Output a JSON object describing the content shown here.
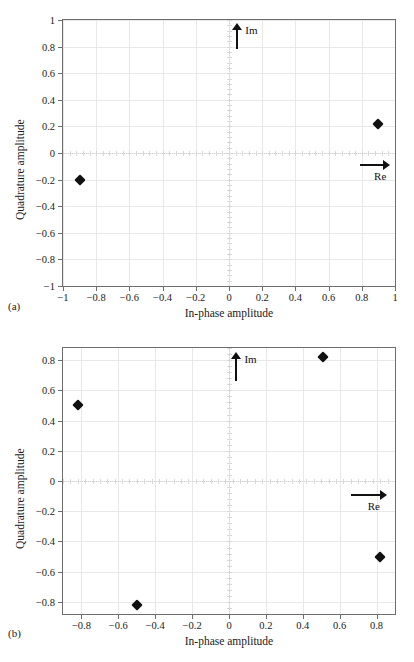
{
  "figure": {
    "subfigures": [
      {
        "caption": "(a)",
        "xlabel": "In-phase amplitude",
        "ylabel": "Quadrature amplitude",
        "im_label": "Im",
        "re_label": "Re"
      },
      {
        "caption": "(b)",
        "xlabel": "In-phase amplitude",
        "ylabel": "Quadrature amplitude",
        "im_label": "Im",
        "re_label": "Re"
      }
    ],
    "colors": {
      "marker": "#111111",
      "grid": "#e8e8e8",
      "frame": "#6d6d6d",
      "dotted_axis": "#d2d2d2",
      "text": "#1a1a1a",
      "background": "#ffffff"
    }
  },
  "chart_data": [
    {
      "type": "scatter",
      "title": "",
      "subtitle": "(a)",
      "xlabel": "In-phase amplitude",
      "ylabel": "Quadrature amplitude",
      "xlim": [
        -1,
        1
      ],
      "ylim": [
        -1,
        1
      ],
      "xticks": [
        -1,
        -0.8,
        -0.6,
        -0.4,
        -0.2,
        0,
        0.2,
        0.4,
        0.6,
        0.8,
        1
      ],
      "yticks": [
        -1,
        -0.8,
        -0.6,
        -0.4,
        -0.2,
        0,
        0.2,
        0.4,
        0.6,
        0.8,
        1
      ],
      "xticklabels": [
        "−1",
        "−0.8",
        "−0.6",
        "−0.4",
        "−0.2",
        "0",
        "0.2",
        "0.4",
        "0.6",
        "0.8",
        "1"
      ],
      "yticklabels": [
        "−1",
        "−0.8",
        "−0.6",
        "−0.4",
        "−0.2",
        "0",
        "0.2",
        "0.4",
        "0.6",
        "0.8",
        "1"
      ],
      "grid": true,
      "legend": null,
      "marker": "diamond",
      "points": [
        {
          "x": -0.9,
          "y": -0.2
        },
        {
          "x": 0.9,
          "y": 0.22
        }
      ],
      "annotations": [
        {
          "text": "Im",
          "type": "axis-arrow",
          "direction": "up",
          "x": 0.05,
          "y_from": 0.78,
          "y_to": 0.98
        },
        {
          "text": "Re",
          "type": "axis-arrow",
          "direction": "right",
          "y": -0.09,
          "x_from": 0.79,
          "x_to": 0.97
        }
      ]
    },
    {
      "type": "scatter",
      "title": "",
      "subtitle": "(b)",
      "xlabel": "In-phase amplitude",
      "ylabel": "Quadrature amplitude",
      "xlim": [
        -0.9,
        0.9
      ],
      "ylim": [
        -0.88,
        0.88
      ],
      "xticks": [
        -0.8,
        -0.6,
        -0.4,
        -0.2,
        0,
        0.2,
        0.4,
        0.6,
        0.8
      ],
      "yticks": [
        -0.8,
        -0.6,
        -0.4,
        -0.2,
        0,
        0.2,
        0.4,
        0.6,
        0.8
      ],
      "xticklabels": [
        "−0.8",
        "−0.6",
        "−0.4",
        "−0.2",
        "0",
        "0.2",
        "0.4",
        "0.6",
        "0.8"
      ],
      "yticklabels": [
        "−0.8",
        "−0.6",
        "−0.4",
        "−0.2",
        "0",
        "0.2",
        "0.4",
        "0.6",
        "0.8"
      ],
      "grid": true,
      "legend": null,
      "marker": "diamond",
      "points": [
        {
          "x": -0.82,
          "y": 0.5
        },
        {
          "x": 0.51,
          "y": 0.82
        },
        {
          "x": -0.5,
          "y": -0.82
        },
        {
          "x": 0.82,
          "y": -0.5
        }
      ],
      "annotations": [
        {
          "text": "Im",
          "type": "axis-arrow",
          "direction": "up",
          "x": 0.04,
          "y_from": 0.66,
          "y_to": 0.855
        },
        {
          "text": "Re",
          "type": "axis-arrow",
          "direction": "right",
          "y": -0.095,
          "x_from": 0.66,
          "x_to": 0.855
        }
      ]
    }
  ]
}
